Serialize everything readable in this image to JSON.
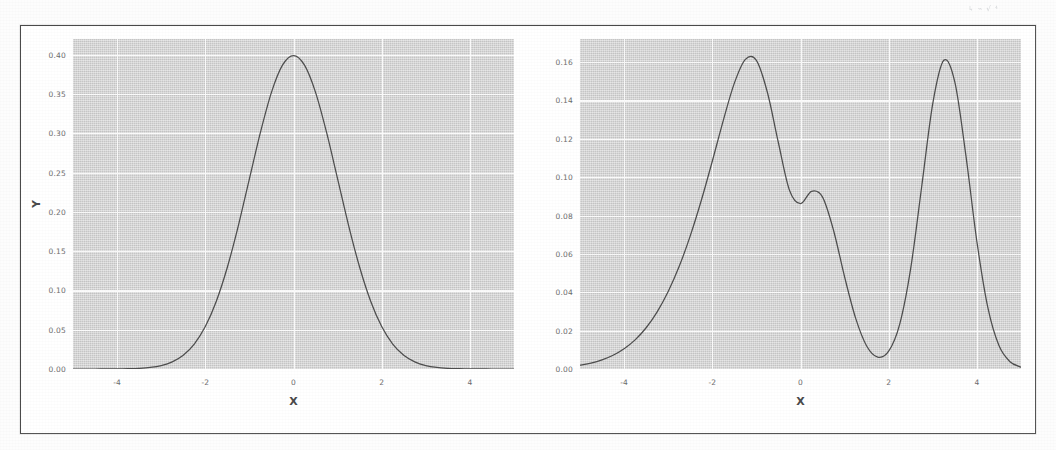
{
  "figure": {
    "background_color": "#fdfdfd",
    "frame_border_color": "#4a4a4a",
    "plot_background_color": "#d6d6d6",
    "grid_color": "#fbfbfb",
    "curve_color": "#4e4e4e",
    "scan_artifact_top_right": "↳ ⌁\n√ ⁴"
  },
  "chart_data": [
    {
      "type": "line",
      "panel": "left",
      "title": "",
      "xlabel": "X",
      "ylabel": "Y",
      "xlim": [
        -5,
        5
      ],
      "ylim": [
        0,
        0.42
      ],
      "grid": true,
      "legend": "none",
      "xticks": [
        "-4",
        "-2",
        "0",
        "2",
        "4"
      ],
      "xtick_values": [
        -4,
        -2,
        0,
        2,
        4
      ],
      "yticks": [
        "0.00",
        "0.05",
        "0.10",
        "0.15",
        "0.20",
        "0.25",
        "0.30",
        "0.35",
        "0.40"
      ],
      "ytick_values": [
        0.0,
        0.05,
        0.1,
        0.15,
        0.2,
        0.25,
        0.3,
        0.35,
        0.4
      ],
      "description": "standard normal probability density, mean 0, standard deviation 1",
      "components": [
        {
          "weight": 1.0,
          "mean": 0.0,
          "sigma": 1.0
        }
      ],
      "peak": {
        "x": 0.0,
        "y": 0.399
      },
      "x": [
        -5.0,
        -4.75,
        -4.5,
        -4.25,
        -4.0,
        -3.75,
        -3.5,
        -3.25,
        -3.0,
        -2.75,
        -2.5,
        -2.25,
        -2.0,
        -1.75,
        -1.5,
        -1.25,
        -1.0,
        -0.75,
        -0.5,
        -0.25,
        0.0,
        0.25,
        0.5,
        0.75,
        1.0,
        1.25,
        1.5,
        1.75,
        2.0,
        2.25,
        2.5,
        2.75,
        3.0,
        3.25,
        3.5,
        3.75,
        4.0,
        4.25,
        4.5,
        4.75,
        5.0
      ],
      "y": [
        0.0,
        0.0,
        0.0,
        0.0001,
        0.0001,
        0.0004,
        0.0009,
        0.002,
        0.0044,
        0.0091,
        0.0175,
        0.0317,
        0.054,
        0.0863,
        0.1295,
        0.1826,
        0.242,
        0.3011,
        0.3521,
        0.3867,
        0.3989,
        0.3867,
        0.3521,
        0.3011,
        0.242,
        0.1826,
        0.1295,
        0.0863,
        0.054,
        0.0317,
        0.0175,
        0.0091,
        0.0044,
        0.002,
        0.0009,
        0.0004,
        0.0001,
        0.0001,
        0.0,
        0.0,
        0.0
      ]
    },
    {
      "type": "line",
      "panel": "right",
      "title": "",
      "xlabel": "X",
      "ylabel": "",
      "xlim": [
        -5,
        5
      ],
      "ylim": [
        0,
        0.172
      ],
      "grid": true,
      "legend": "none",
      "xticks": [
        "-4",
        "-2",
        "0",
        "2",
        "4"
      ],
      "xtick_values": [
        -4,
        -2,
        0,
        2,
        4
      ],
      "yticks": [
        "0.00",
        "0.02",
        "0.04",
        "0.06",
        "0.08",
        "0.10",
        "0.12",
        "0.14",
        "0.16"
      ],
      "ytick_values": [
        0.0,
        0.02,
        0.04,
        0.06,
        0.08,
        0.1,
        0.12,
        0.14,
        0.16
      ],
      "description": "three-component Gaussian mixture probability density",
      "components": [
        {
          "weight": 0.45,
          "mean": -2.0,
          "sigma": 1.0
        },
        {
          "weight": 0.25,
          "mean": -0.2,
          "sigma": 0.8
        },
        {
          "weight": 0.3,
          "mean": 3.0,
          "sigma": 0.6
        }
      ],
      "peaks": [
        {
          "x": -1.95,
          "y": 0.163
        },
        {
          "x": -0.15,
          "y": 0.125
        },
        {
          "x": 3.0,
          "y": 0.14
        }
      ],
      "valleys": [
        {
          "x": -0.95,
          "y": 0.113
        },
        {
          "x": 1.7,
          "y": 0.008
        }
      ],
      "x": [
        -5.0,
        -4.75,
        -4.5,
        -4.25,
        -4.0,
        -3.75,
        -3.5,
        -3.25,
        -3.0,
        -2.75,
        -2.5,
        -2.25,
        -2.0,
        -1.75,
        -1.5,
        -1.25,
        -1.0,
        -0.75,
        -0.5,
        -0.25,
        0.0,
        0.25,
        0.5,
        0.75,
        1.0,
        1.25,
        1.5,
        1.75,
        2.0,
        2.25,
        2.5,
        2.75,
        3.0,
        3.25,
        3.5,
        3.75,
        4.0,
        4.25,
        4.5,
        4.75,
        5.0
      ],
      "y": [
        0.002,
        0.0031,
        0.0048,
        0.0072,
        0.0106,
        0.0152,
        0.0215,
        0.0298,
        0.0404,
        0.0535,
        0.0694,
        0.0878,
        0.1083,
        0.1296,
        0.149,
        0.1614,
        0.1609,
        0.1441,
        0.1178,
        0.0932,
        0.0862,
        0.0926,
        0.0896,
        0.0722,
        0.048,
        0.0265,
        0.012,
        0.0062,
        0.0093,
        0.0234,
        0.0526,
        0.0954,
        0.1385,
        0.1609,
        0.1495,
        0.1113,
        0.0664,
        0.0318,
        0.0122,
        0.0038,
        0.001
      ]
    }
  ]
}
